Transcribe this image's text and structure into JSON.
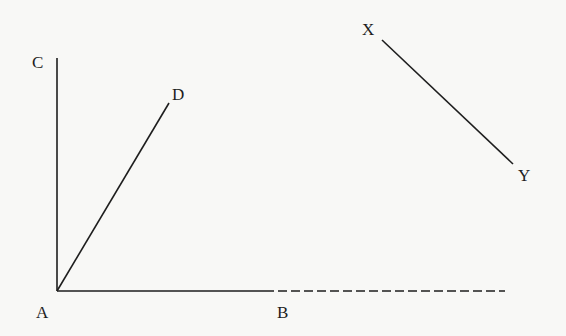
{
  "diagram": {
    "colors": {
      "background": "#f8f8f6",
      "stroke": "#1e1e1e"
    },
    "points": {
      "A": {
        "label": "A",
        "x": 57,
        "y": 291
      },
      "B": {
        "label": "B",
        "x": 265,
        "y": 291
      },
      "C": {
        "label": "C",
        "x": 57,
        "y": 58
      },
      "D": {
        "label": "D",
        "x": 169,
        "y": 103
      },
      "X": {
        "label": "X",
        "x": 382,
        "y": 40
      },
      "Y": {
        "label": "Y",
        "x": 513,
        "y": 164
      }
    },
    "segments": [
      {
        "from": "A",
        "to": "C",
        "style": "solid"
      },
      {
        "from": "A",
        "to": "D",
        "style": "solid"
      },
      {
        "from": "A",
        "to": "B",
        "style": "solid"
      },
      {
        "from": "B",
        "to": "end",
        "style": "dashed",
        "end_x": 505
      },
      {
        "from": "X",
        "to": "Y",
        "style": "solid"
      }
    ]
  }
}
